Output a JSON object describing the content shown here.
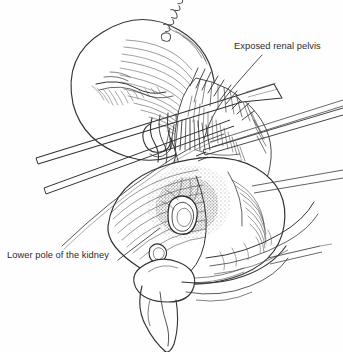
{
  "figure": {
    "kind": "medical-line-illustration",
    "technique": "pen-and-ink line drawing with cross-hatching and stipple shading",
    "background_color": "#fefefe",
    "ink_color": "#333333",
    "line_color_light": "#6b6b6b",
    "width": 343,
    "height": 352
  },
  "labels": [
    {
      "id": "exposed-renal-pelvis",
      "text": "Exposed renal pelvis",
      "position": "top-right",
      "leader": "curved line descending left-down to the surgical field"
    },
    {
      "id": "lower-pole-of-the-kidney",
      "text": "Lower pole of the kidney",
      "position": "bottom-left",
      "leader": "short straight line angled up-right to the kidney lower pole"
    }
  ],
  "signature": {
    "text": "artist-signature",
    "legible": false,
    "rotation_deg": -58,
    "description": "handwritten cursive initials in upper centre"
  },
  "anatomy": {
    "upper_pole": "large ovoid kidney upper pole, upper left, hatch-shaded",
    "lower_pole": "rounded kidney lower pole, lower centre",
    "renal_pelvis": "stippled oval cavity at centre, exposed between poles",
    "hilar_vessels": "looping vessel outlines at the kidney hilum",
    "perinephric_tissue": "dense hatched fat and fascia around the hilum"
  },
  "instruments": {
    "retractor_blades": "two long parallel blades crossing diagonally lower-left to upper-right",
    "forceps": "slender forceps entering from the right edge toward the pelvis",
    "surgeon_hand": "gloved fingers supporting the lower pole at bottom centre"
  }
}
